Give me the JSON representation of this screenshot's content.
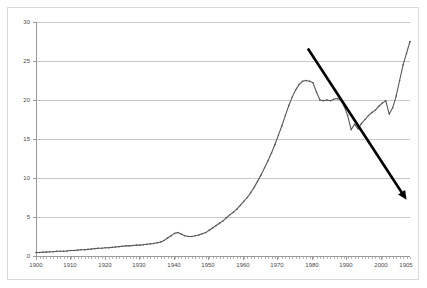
{
  "chart_data": {
    "type": "line",
    "title": "",
    "subtitle": "",
    "xlabel": "",
    "ylabel": "",
    "xlim": [
      1900,
      2008
    ],
    "ylim": [
      0,
      30
    ],
    "grid": true,
    "legend": "none",
    "y_ticks": [
      0,
      5,
      10,
      15,
      20,
      25,
      30
    ],
    "y_tick_labels": [
      "0",
      "5",
      "10",
      "15",
      "20",
      "25",
      "30"
    ],
    "x_ticks": [
      1900,
      1910,
      1920,
      1930,
      1940,
      1950,
      1960,
      1970,
      1980,
      1990,
      2000,
      2005
    ],
    "x_tick_labels": [
      "1900",
      "1910",
      "1920",
      "1930",
      "1940",
      "1950",
      "1960",
      "1970",
      "1980",
      "1990",
      "2000",
      "1905"
    ],
    "x_minor_tick_step": 1,
    "series": [
      {
        "name": "main-series",
        "color": "#595959",
        "marker": "diamond",
        "x": [
          1900,
          1901,
          1902,
          1903,
          1904,
          1905,
          1906,
          1907,
          1908,
          1909,
          1910,
          1911,
          1912,
          1913,
          1914,
          1915,
          1916,
          1917,
          1918,
          1919,
          1920,
          1921,
          1922,
          1923,
          1924,
          1925,
          1926,
          1927,
          1928,
          1929,
          1930,
          1931,
          1932,
          1933,
          1934,
          1935,
          1936,
          1937,
          1938,
          1939,
          1940,
          1941,
          1942,
          1943,
          1944,
          1945,
          1946,
          1947,
          1948,
          1949,
          1950,
          1951,
          1952,
          1953,
          1954,
          1955,
          1956,
          1957,
          1958,
          1959,
          1960,
          1961,
          1962,
          1963,
          1964,
          1965,
          1966,
          1967,
          1968,
          1969,
          1970,
          1971,
          1972,
          1973,
          1974,
          1975,
          1976,
          1977,
          1978,
          1979,
          1980,
          1981,
          1982,
          1983,
          1984,
          1985,
          1986,
          1987,
          1988,
          1989,
          1990,
          1991,
          1992,
          1993,
          1994,
          1995,
          1996,
          1997,
          1998,
          1999,
          2000,
          2001,
          2002,
          2003,
          2004,
          2005,
          2006,
          2007
        ],
        "values": [
          0.45,
          0.45,
          0.5,
          0.5,
          0.55,
          0.55,
          0.6,
          0.6,
          0.6,
          0.65,
          0.7,
          0.7,
          0.75,
          0.8,
          0.8,
          0.85,
          0.9,
          0.95,
          1.0,
          1.0,
          1.05,
          1.05,
          1.1,
          1.15,
          1.2,
          1.25,
          1.3,
          1.3,
          1.35,
          1.4,
          1.4,
          1.45,
          1.5,
          1.55,
          1.6,
          1.7,
          1.8,
          2.0,
          2.3,
          2.6,
          2.9,
          3.0,
          2.8,
          2.6,
          2.5,
          2.5,
          2.6,
          2.7,
          2.85,
          3.0,
          3.3,
          3.6,
          3.9,
          4.2,
          4.5,
          4.9,
          5.3,
          5.6,
          6.0,
          6.5,
          7.0,
          7.5,
          8.1,
          8.8,
          9.6,
          10.4,
          11.3,
          12.2,
          13.2,
          14.3,
          15.5,
          16.7,
          18.0,
          19.3,
          20.4,
          21.3,
          22.0,
          22.4,
          22.5,
          22.4,
          22.2,
          21.0,
          20.0,
          19.9,
          20.0,
          19.9,
          20.1,
          20.2,
          20.0,
          19.2,
          18.0,
          16.2,
          16.9,
          16.3,
          17.0,
          17.5,
          18.0,
          18.4,
          18.7,
          19.2,
          19.6,
          19.9,
          19.8,
          19.4,
          19.8,
          20.5,
          20.2,
          19.4
        ],
        "values_tail": {
          "x": [
            2002,
            2003,
            2004,
            2005,
            2006,
            2007,
            2008
          ],
          "values": [
            18.2,
            19.0,
            20.5,
            22.5,
            24.5,
            26.0,
            27.5
          ]
        }
      }
    ],
    "annotations": [
      {
        "name": "trend-arrow",
        "type": "arrow",
        "color": "#000000",
        "start": {
          "x": 1978.5,
          "y": 26.6
        },
        "end": {
          "x": 2007.0,
          "y": 7.2
        },
        "arrowhead": "end",
        "width_px": 2.6,
        "label": ""
      }
    ]
  }
}
